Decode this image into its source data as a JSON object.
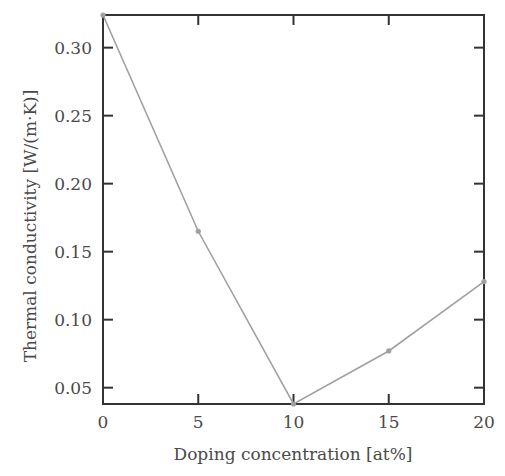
{
  "chart_data": {
    "type": "line",
    "title": "",
    "xlabel": "Doping concentration [at%]",
    "ylabel": "Thermal conductivity [W/(m·K)]",
    "x": [
      0,
      5,
      10,
      15,
      20
    ],
    "series": [
      {
        "name": "Thermal conductivity",
        "values": [
          0.324,
          0.165,
          0.038,
          0.077,
          0.128
        ],
        "color": "#a0a0a0"
      }
    ],
    "xlim": [
      0,
      20
    ],
    "ylim": [
      0.038,
      0.324
    ],
    "x_ticks": [
      0,
      5,
      10,
      15,
      20
    ],
    "x_tick_labels": [
      "0",
      "5",
      "10",
      "15",
      "20"
    ],
    "y_ticks": [
      0.05,
      0.1,
      0.15,
      0.2,
      0.25,
      0.3
    ],
    "y_tick_labels": [
      "0.05",
      "0.10",
      "0.15",
      "0.20",
      "0.25",
      "0.30"
    ],
    "grid": false,
    "legend": null,
    "axis_color": "#333333"
  }
}
